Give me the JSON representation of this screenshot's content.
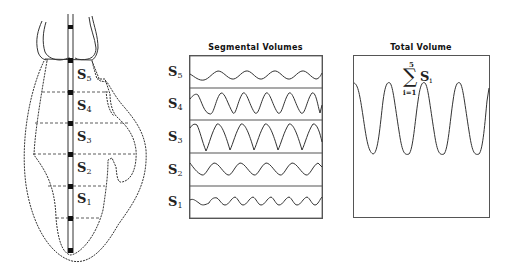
{
  "heart_diagram": {
    "segments": [
      {
        "label": "S",
        "sub": "5"
      },
      {
        "label": "S",
        "sub": "4"
      },
      {
        "label": "S",
        "sub": "3"
      },
      {
        "label": "S",
        "sub": "2"
      },
      {
        "label": "S",
        "sub": "1"
      }
    ]
  },
  "segmental_panel": {
    "title": "Segmental Volumes",
    "rows": [
      {
        "label": "S",
        "sub": "5"
      },
      {
        "label": "S",
        "sub": "4"
      },
      {
        "label": "S",
        "sub": "3"
      },
      {
        "label": "S",
        "sub": "2"
      },
      {
        "label": "S",
        "sub": "1"
      }
    ]
  },
  "total_panel": {
    "title": "Total Volume",
    "formula": {
      "sigma": "∑",
      "upper": "5",
      "lower": "i=1",
      "term": "S",
      "term_sub": "i"
    }
  },
  "colors": {
    "line": "#333333",
    "box": "#555555",
    "background": "#ffffff"
  }
}
